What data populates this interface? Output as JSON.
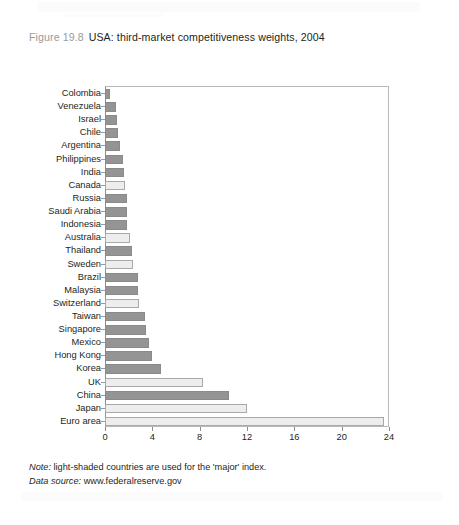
{
  "figure": {
    "number": "Figure 19.8",
    "title": "USA: third-market competitiveness weights, 2004"
  },
  "notes": {
    "note_label": "Note:",
    "note_text": " light-shaded countries are used for the 'major' index.",
    "source_label": "Data source:",
    "source_text": " www.federalreserve.gov"
  },
  "legend_meaning": {
    "light": "major index country",
    "dark": "other index country"
  },
  "colors": {
    "dark_bar": "#949494",
    "light_bar": "#ededed",
    "bar_border_dark": "#8a8a8a",
    "bar_border_light": "#a9a9a9",
    "axis": "#8d8d8d",
    "title_number": "#9a9a9a",
    "text": "#231f20"
  },
  "chart_data": {
    "type": "bar",
    "orientation": "horizontal",
    "title": "USA: third-market competitiveness weights, 2004",
    "xlabel": "",
    "ylabel": "",
    "xlim": [
      0,
      24
    ],
    "xticks": [
      0,
      4,
      8,
      12,
      16,
      20,
      24
    ],
    "grid": false,
    "legend": "none",
    "categories": [
      "Colombia",
      "Venezuela",
      "Israel",
      "Chile",
      "Argentina",
      "Philippines",
      "India",
      "Canada",
      "Russia",
      "Saudi Arabia",
      "Indonesia",
      "Australia",
      "Thailand",
      "Sweden",
      "Brazil",
      "Malaysia",
      "Switzerland",
      "Taiwan",
      "Singapore",
      "Mexico",
      "Hong Kong",
      "Korea",
      "UK",
      "China",
      "Japan",
      "Euro area"
    ],
    "values": [
      0.4,
      0.9,
      1.0,
      1.1,
      1.3,
      1.5,
      1.6,
      1.7,
      1.9,
      1.9,
      1.9,
      2.1,
      2.3,
      2.4,
      2.8,
      2.8,
      2.9,
      3.4,
      3.5,
      3.7,
      4.0,
      4.7,
      8.3,
      10.5,
      12.0,
      23.6
    ],
    "shades": [
      "dark",
      "dark",
      "dark",
      "dark",
      "dark",
      "dark",
      "dark",
      "light",
      "dark",
      "dark",
      "dark",
      "light",
      "dark",
      "light",
      "dark",
      "dark",
      "light",
      "dark",
      "dark",
      "dark",
      "dark",
      "dark",
      "light",
      "dark",
      "light",
      "light"
    ]
  }
}
